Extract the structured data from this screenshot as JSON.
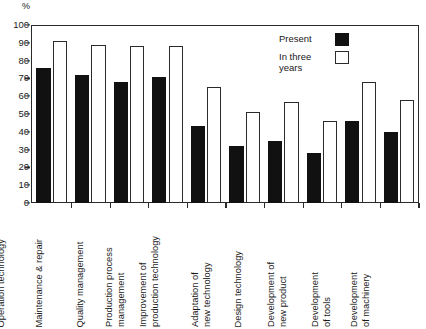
{
  "chart_data": {
    "type": "bar",
    "title": "",
    "subtitle": "",
    "xlabel": "",
    "ylabel": "%",
    "ylim": [
      0,
      100
    ],
    "yticks": [
      0,
      10,
      20,
      30,
      40,
      50,
      60,
      70,
      80,
      90,
      100
    ],
    "grid": false,
    "legend_position": "top-right",
    "categories": [
      "Operation technology",
      "Maintenance & repair",
      "Quality management",
      "Production process\nmanagement",
      "Improvement of\nproduction technology",
      "Adaptation of\nnew technology",
      "Design technology",
      "Development of\nnew product",
      "Development\nof tools",
      "Development\nof machinery"
    ],
    "series": [
      {
        "name": "Present",
        "color": "#111111",
        "values": [
          76,
          72,
          68,
          71,
          43,
          32,
          35,
          28,
          46,
          40
        ]
      },
      {
        "name": "In three\nyears",
        "color": "#ffffff",
        "values": [
          91,
          89,
          88,
          88,
          65,
          51,
          57,
          46,
          68,
          58
        ]
      }
    ]
  },
  "axis": {
    "unit_label": "%"
  },
  "legend": {
    "entries": [
      {
        "label": "Present",
        "swatch": "filled-black-square"
      },
      {
        "label": "In three\nyears",
        "swatch": "outlined-white-square"
      }
    ]
  }
}
